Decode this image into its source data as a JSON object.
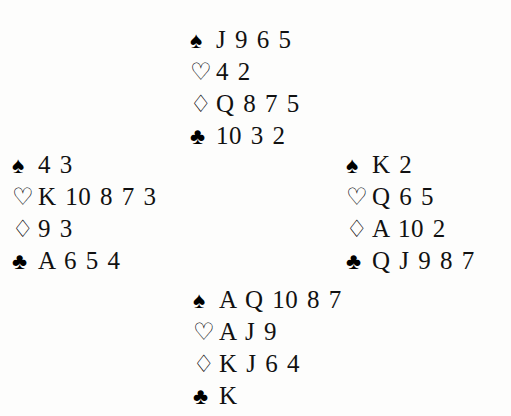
{
  "diagram": {
    "background_color": "#fdfdfc",
    "text_color": "#111111",
    "suits": [
      {
        "key": "spades",
        "name": "spade-suit-symbol",
        "glyph": "♠",
        "filled": true,
        "label": "Spades"
      },
      {
        "key": "hearts",
        "name": "heart-suit-symbol",
        "glyph": "♡",
        "filled": false,
        "label": "Hearts"
      },
      {
        "key": "diamonds",
        "name": "diamond-suit-symbol",
        "glyph": "♢",
        "filled": false,
        "label": "Diamonds"
      },
      {
        "key": "clubs",
        "name": "club-suit-symbol",
        "glyph": "♣",
        "filled": true,
        "label": "Clubs"
      }
    ],
    "hands": {
      "north": {
        "position": "North",
        "spades": "J 9 6 5",
        "hearts": "4 2",
        "diamonds": "Q 8 7 5",
        "clubs": "10 3 2"
      },
      "west": {
        "position": "West",
        "spades": "4 3",
        "hearts": "K 10 8 7 3",
        "diamonds": "9 3",
        "clubs": "A 6 5 4"
      },
      "east": {
        "position": "East",
        "spades": "K 2",
        "hearts": "Q 6 5",
        "diamonds": "A 10 2",
        "clubs": "Q J 9 8 7"
      },
      "south": {
        "position": "South",
        "spades": "A Q 10 8 7",
        "hearts": "A J 9",
        "diamonds": "K J 6 4",
        "clubs": "K"
      }
    }
  }
}
